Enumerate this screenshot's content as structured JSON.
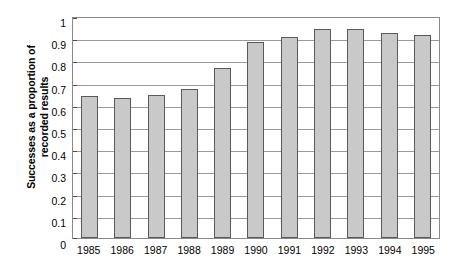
{
  "chart_data": {
    "type": "bar",
    "title": "",
    "xlabel": "",
    "ylabel": "Successes as a proportion of recorded results",
    "ylabel_lines": [
      "Successes as a proportion of",
      "recorded results"
    ],
    "categories": [
      "1985",
      "1986",
      "1987",
      "1988",
      "1989",
      "1990",
      "1991",
      "1992",
      "1993",
      "1994",
      "1995"
    ],
    "values": [
      0.64,
      0.63,
      0.645,
      0.67,
      0.765,
      0.885,
      0.905,
      0.94,
      0.94,
      0.925,
      0.915
    ],
    "series": [
      {
        "name": "Successes as a proportion of recorded results",
        "values": [
          0.64,
          0.63,
          0.645,
          0.67,
          0.765,
          0.885,
          0.905,
          0.94,
          0.94,
          0.925,
          0.915
        ]
      }
    ],
    "ylim": [
      0,
      1
    ],
    "ytick_values": [
      1,
      0.9,
      0.8,
      0.7,
      0.6,
      0.5,
      0.4,
      0.3,
      0.2,
      0.1,
      0
    ],
    "ytick_labels": [
      "1",
      "0.9",
      "0.8",
      "0.7",
      "0.6",
      "0.5",
      "0.4",
      "0.3",
      "0.2",
      "0.1",
      "0"
    ],
    "grid": true,
    "legend": false,
    "legend_position": "none",
    "colors": {
      "bar_fill": "#c9c9c9",
      "bar_border": "#595959",
      "gridline": "#9a9a9a",
      "axis": "#8a8a8a",
      "text": "#000000",
      "background": "#ffffff"
    }
  }
}
